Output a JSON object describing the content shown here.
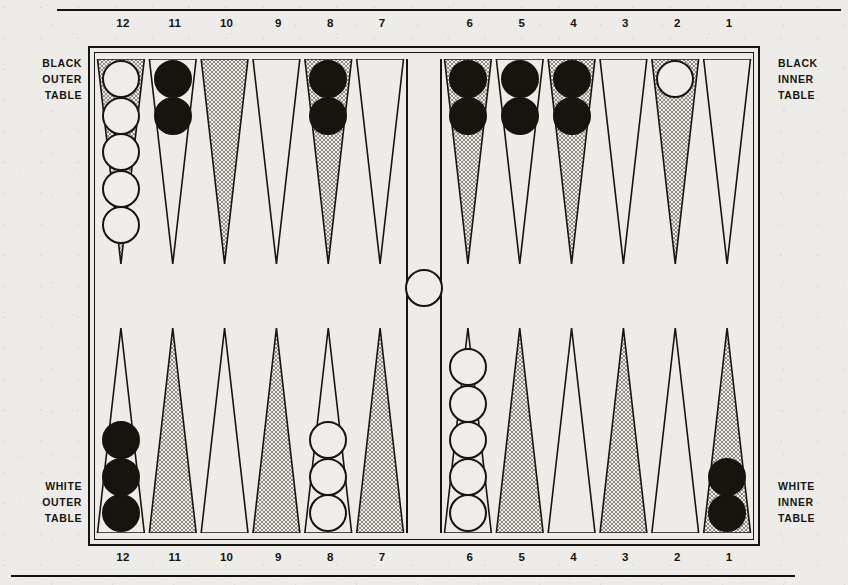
{
  "figure": {
    "kind": "backgammon-board-diagram"
  },
  "labels": {
    "black_outer": "BLACK\nOUTER\nTABLE",
    "black_inner": "BLACK\nINNER\nTABLE",
    "white_outer": "WHITE\nOUTER\nTABLE",
    "white_inner": "WHITE\nINNER\nTABLE"
  },
  "scale": {
    "top": [
      "12",
      "11",
      "10",
      "9",
      "8",
      "7",
      "6",
      "5",
      "4",
      "3",
      "2",
      "1"
    ],
    "bottom": [
      "12",
      "11",
      "10",
      "9",
      "8",
      "7",
      "6",
      "5",
      "4",
      "3",
      "2",
      "1"
    ]
  },
  "colors": {
    "ink": "#17150f",
    "paper": "#edece8",
    "checker_black": "#16140f",
    "checker_white": "#eeedea",
    "point_shaded": "#c9c7c1",
    "point_plain": "#edece8"
  },
  "chart_data": {
    "type": "diagram",
    "notation": "Points numbered 12 to 1 from left to right on both halves; bar separates points 7 and 6.",
    "top_row": [
      {
        "point": "12",
        "shaded": true,
        "checkers": 5,
        "color": "white"
      },
      {
        "point": "11",
        "shaded": false,
        "checkers": 2,
        "color": "black"
      },
      {
        "point": "10",
        "shaded": true,
        "checkers": 0,
        "color": null
      },
      {
        "point": "9",
        "shaded": false,
        "checkers": 0,
        "color": null
      },
      {
        "point": "8",
        "shaded": true,
        "checkers": 2,
        "color": "black"
      },
      {
        "point": "7",
        "shaded": false,
        "checkers": 0,
        "color": null
      },
      {
        "point": "6",
        "shaded": true,
        "checkers": 2,
        "color": "black"
      },
      {
        "point": "5",
        "shaded": false,
        "checkers": 2,
        "color": "black"
      },
      {
        "point": "4",
        "shaded": true,
        "checkers": 2,
        "color": "black"
      },
      {
        "point": "3",
        "shaded": false,
        "checkers": 0,
        "color": null
      },
      {
        "point": "2",
        "shaded": true,
        "checkers": 1,
        "color": "white"
      },
      {
        "point": "1",
        "shaded": false,
        "checkers": 0,
        "color": null
      }
    ],
    "bottom_row": [
      {
        "point": "12",
        "shaded": false,
        "checkers": 3,
        "color": "black"
      },
      {
        "point": "11",
        "shaded": true,
        "checkers": 0,
        "color": null
      },
      {
        "point": "10",
        "shaded": false,
        "checkers": 0,
        "color": null
      },
      {
        "point": "9",
        "shaded": true,
        "checkers": 0,
        "color": null
      },
      {
        "point": "8",
        "shaded": false,
        "checkers": 3,
        "color": "white"
      },
      {
        "point": "7",
        "shaded": true,
        "checkers": 0,
        "color": null
      },
      {
        "point": "6",
        "shaded": false,
        "checkers": 5,
        "color": "white"
      },
      {
        "point": "5",
        "shaded": true,
        "checkers": 0,
        "color": null
      },
      {
        "point": "4",
        "shaded": false,
        "checkers": 0,
        "color": null
      },
      {
        "point": "3",
        "shaded": true,
        "checkers": 0,
        "color": null
      },
      {
        "point": "2",
        "shaded": false,
        "checkers": 0,
        "color": null
      },
      {
        "point": "1",
        "shaded": true,
        "checkers": 2,
        "color": "black"
      }
    ],
    "bar": {
      "checkers": 1,
      "color": "white"
    },
    "totals": {
      "white": 15,
      "black": 15
    }
  }
}
